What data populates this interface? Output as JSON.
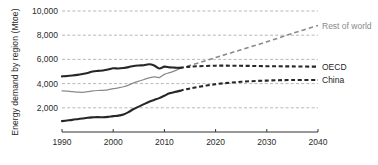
{
  "chart_data": {
    "type": "line",
    "title": "",
    "xlabel": "",
    "ylabel": "Energy demand by region (Mtoe)",
    "xlim": [
      1990,
      2040
    ],
    "ylim": [
      0,
      10000
    ],
    "grid": true,
    "legend_position": "right-inline",
    "x_ticks": [
      "1990",
      "2000",
      "2010",
      "2020",
      "2030",
      "2040"
    ],
    "x_tick_values": [
      1990,
      2000,
      2010,
      2020,
      2030,
      2040
    ],
    "y_ticks": [
      "2,000",
      "4,000",
      "6,000",
      "8,000",
      "10,000"
    ],
    "y_tick_values": [
      2000,
      4000,
      6000,
      8000,
      10000
    ],
    "history_end": 2013,
    "series": [
      {
        "name": "Rest of world",
        "color": "#8a8a8a",
        "label": "Rest of world",
        "label_value": 8800,
        "x": [
          1990,
          1991,
          1992,
          1993,
          1994,
          1995,
          1996,
          1997,
          1998,
          1999,
          2000,
          2001,
          2002,
          2003,
          2004,
          2005,
          2006,
          2007,
          2008,
          2009,
          2010,
          2011,
          2012,
          2013,
          2015,
          2020,
          2025,
          2030,
          2035,
          2040
        ],
        "values": [
          3400,
          3380,
          3330,
          3300,
          3280,
          3330,
          3400,
          3430,
          3440,
          3490,
          3580,
          3650,
          3740,
          3880,
          4060,
          4200,
          4340,
          4470,
          4560,
          4500,
          4760,
          4900,
          5050,
          5250,
          5500,
          6150,
          6800,
          7450,
          8150,
          8800
        ]
      },
      {
        "name": "OECD",
        "color": "#262626",
        "label": "OECD",
        "label_value": 5400,
        "x": [
          1990,
          1991,
          1992,
          1993,
          1994,
          1995,
          1996,
          1997,
          1998,
          1999,
          2000,
          2001,
          2002,
          2003,
          2004,
          2005,
          2006,
          2007,
          2008,
          2009,
          2010,
          2011,
          2012,
          2013,
          2015,
          2020,
          2025,
          2030,
          2035,
          2040
        ],
        "values": [
          4600,
          4630,
          4670,
          4720,
          4790,
          4880,
          5000,
          5050,
          5080,
          5160,
          5270,
          5250,
          5290,
          5360,
          5460,
          5500,
          5520,
          5600,
          5500,
          5250,
          5400,
          5340,
          5320,
          5300,
          5400,
          5480,
          5470,
          5440,
          5420,
          5400
        ]
      },
      {
        "name": "China",
        "color": "#262626",
        "label": "China",
        "label_value": 4300,
        "x": [
          1990,
          1991,
          1992,
          1993,
          1994,
          1995,
          1996,
          1997,
          1998,
          1999,
          2000,
          2001,
          2002,
          2003,
          2004,
          2005,
          2006,
          2007,
          2008,
          2009,
          2010,
          2011,
          2012,
          2013,
          2015,
          2020,
          2025,
          2030,
          2035,
          2040
        ],
        "values": [
          900,
          950,
          1000,
          1060,
          1120,
          1180,
          1210,
          1230,
          1220,
          1250,
          1310,
          1350,
          1450,
          1650,
          1900,
          2100,
          2300,
          2500,
          2650,
          2800,
          3000,
          3200,
          3300,
          3400,
          3600,
          3950,
          4150,
          4250,
          4300,
          4300
        ]
      }
    ]
  },
  "axis": {
    "y_label": "Energy demand by region (Mtoe)"
  }
}
